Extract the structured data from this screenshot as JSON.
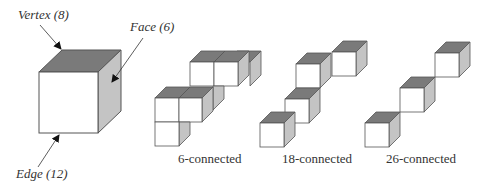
{
  "colors": {
    "top": "#7a7a7a",
    "side": "#c4c4c4",
    "front": "#ffffff",
    "stroke": "#555555"
  },
  "annotations": {
    "vertex": "Vertex (8)",
    "face": "Face (6)",
    "edge": "Edge (12)"
  },
  "groups": [
    {
      "label": "6-connected"
    },
    {
      "label": "18-connected"
    },
    {
      "label": "26-connected"
    }
  ]
}
